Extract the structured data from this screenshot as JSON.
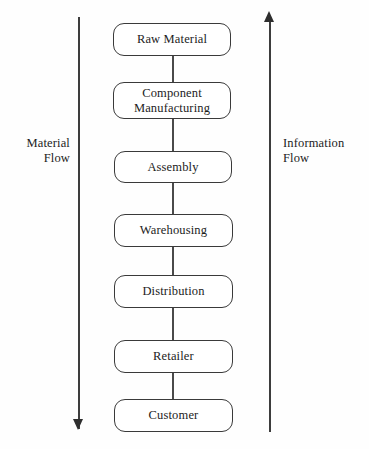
{
  "diagram": {
    "background_color": "#fefefe",
    "line_color": "#3a3a3a",
    "text_color": "#1c1c1c",
    "nodes": [
      {
        "label": "Raw Material",
        "lines": [
          "Raw Material"
        ]
      },
      {
        "label": "Component Manufacturing",
        "lines": [
          "Component",
          "Manufacturing"
        ]
      },
      {
        "label": "Assembly",
        "lines": [
          "Assembly"
        ]
      },
      {
        "label": "Warehousing",
        "lines": [
          "Warehousing"
        ]
      },
      {
        "label": "Distribution",
        "lines": [
          "Distribution"
        ]
      },
      {
        "label": "Retailer",
        "lines": [
          "Retailer"
        ]
      },
      {
        "label": "Customer",
        "lines": [
          "Customer"
        ]
      }
    ],
    "flows": {
      "left": {
        "caption": "Material\nFlow",
        "direction": "down"
      },
      "right": {
        "caption": "Information\nFlow",
        "direction": "up"
      }
    }
  }
}
